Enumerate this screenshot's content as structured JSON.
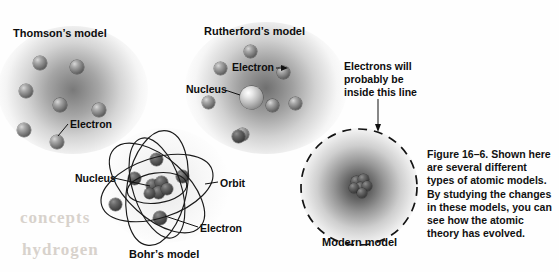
{
  "figure": {
    "number": "Figure 16–6.",
    "caption_text": " Shown here are several different types of atomic models. By studying the changes in these models, you can see how the atomic theory has evolved."
  },
  "models": {
    "thomson": {
      "title": "Thomson’s model",
      "electron_label": "Electron"
    },
    "rutherford": {
      "title": "Rutherford’s model",
      "electron_label": "Electron",
      "nucleus_label": "Nucleus"
    },
    "bohr": {
      "title": "Bohr’s model",
      "nucleus_label": "Nucleus",
      "orbit_label": "Orbit",
      "electron_label": "Electron"
    },
    "modern": {
      "title": "Modern model",
      "boundary_label_line1": "Electrons will",
      "boundary_label_line2": "probably be",
      "boundary_label_line3": "inside this line"
    }
  },
  "bleed_through": {
    "line1": "concepts",
    "line2": "hydrogen"
  },
  "colors": {
    "ink": "#0d0d0d",
    "page": "#fefefe",
    "sphere_light": "#d8d8d8",
    "sphere_dark": "#3e3e3e",
    "halo": "#585858"
  }
}
